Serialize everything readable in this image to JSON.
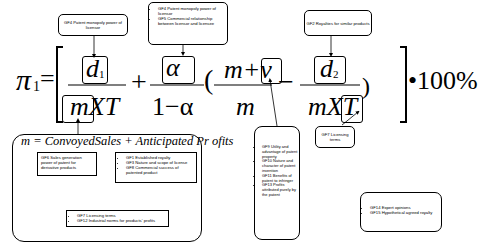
{
  "formula": {
    "lhs": "π",
    "lhs_sub": "1",
    "equals": "=",
    "term1_num": "d",
    "term1_num_sub": "1",
    "term1_den": "mXT",
    "plus": "+",
    "term2_num": "α",
    "term2_den": "1−α",
    "open_paren": "(",
    "term3_num": "m+v",
    "term3_den": "m",
    "minus": "−",
    "term4_num": "d",
    "term4_num_sub": "2",
    "term4_den": "mXT",
    "close_paren": ")",
    "multiplier": "•100%",
    "m_definition": "m = ConvoyedSales + Anticipated Pr ofits"
  },
  "callouts": {
    "gf4": "GF4 Patent monopoly power of licensor",
    "gf4_gf5": [
      "GF4 Patent monopoly power of licensor",
      "GF5 Commercial relationship between licensor and licensee"
    ],
    "gf2": "GF2 Royalties for similar products",
    "gf7_right": "GF7 Licensing terms",
    "gf6": "GF6 Sales generation power of patent for derivative products",
    "gf1_gf3_gf8": [
      "GF1 Established royalty",
      "GF3 Nature and scope of license",
      "GF8 Commercial success of patented product"
    ],
    "gf7_gf12": [
      "GF7 Licensing terms",
      "GF12 Industrial norms for products' profits"
    ],
    "gf9_gf13": [
      "GF9 Utility and advantage of patent property",
      "GF10 Nature and character of patent invention",
      "GF11 Benefits of patent to infringer",
      "GF13 Profits attributed purely by the patent"
    ],
    "gf14_gf15": [
      "GF14 Expert opinions",
      "GF15 Hypothetical agreed royalty"
    ]
  }
}
